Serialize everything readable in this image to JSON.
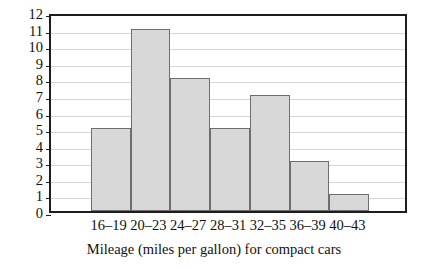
{
  "chart_data": {
    "type": "bar",
    "title": "",
    "subtitle": "",
    "xlabel": "Mileage (miles per gallon) for compact cars",
    "ylabel": "Frequency",
    "categories": [
      "16–19",
      "20–23",
      "24–27",
      "28–31",
      "32–35",
      "36–39",
      "40–43"
    ],
    "values": [
      5,
      11,
      8,
      5,
      7,
      3,
      1
    ],
    "ylim": [
      0,
      12
    ],
    "ytick_labels": [
      "0",
      "1",
      "2",
      "3",
      "4",
      "5",
      "6",
      "7",
      "8",
      "9",
      "10",
      "11",
      "12"
    ],
    "ytick_values": [
      0,
      1,
      2,
      3,
      4,
      5,
      6,
      7,
      8,
      9,
      10,
      11,
      12
    ],
    "grid": "horizontal",
    "legend": "none",
    "bar_fill_color": "#d8d8d8",
    "bar_edge_color": "#6e6e6e",
    "frame_color": "#1d1d1d",
    "gridline_color": "#d6d6d6",
    "background_color": "#ffffff",
    "bars_start_offset_units": 1,
    "bars_end_offset_units": 1,
    "total_x_slots": 9
  }
}
